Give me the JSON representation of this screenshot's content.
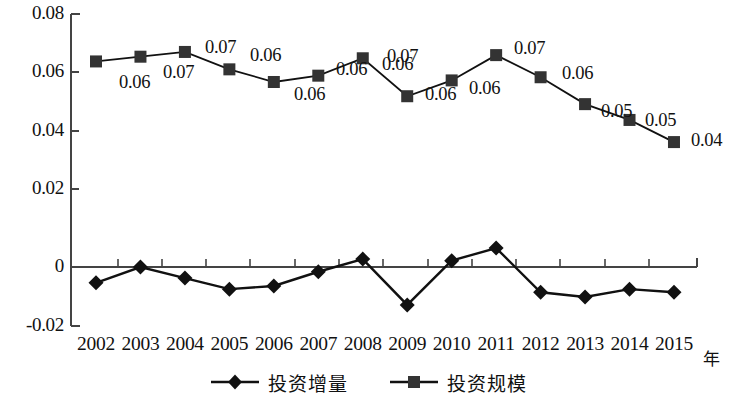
{
  "chart_data": {
    "type": "line",
    "title": "",
    "xlabel": "年",
    "ylabel": "",
    "grid": false,
    "legend_position": "bottom",
    "xlim": [
      2002,
      2015
    ],
    "ylim": [
      -0.02,
      0.08
    ],
    "categories": [
      "2002",
      "2003",
      "2004",
      "2005",
      "2006",
      "2007",
      "2008",
      "2009",
      "2010",
      "2011",
      "2012",
      "2013",
      "2014",
      "2015"
    ],
    "y_ticks": [
      "0.08",
      "0.06",
      "0.04",
      "0.02",
      "0",
      "-0.02"
    ],
    "y_tick_values": [
      0.08,
      0.06,
      0.04,
      0.02,
      0,
      -0.02
    ],
    "series": [
      {
        "name": "投资增量",
        "marker": "diamond",
        "color": "#111111",
        "values": [
          -0.005,
          0.0,
          -0.0035,
          -0.007,
          -0.006,
          -0.0015,
          0.0025,
          -0.012,
          0.002,
          0.006,
          -0.008,
          -0.0095,
          -0.007,
          -0.008
        ],
        "labels": [
          "",
          "",
          "",
          "",
          "",
          "",
          "",
          "",
          "",
          "",
          "",
          "",
          "",
          ""
        ]
      },
      {
        "name": "投资规模",
        "marker": "square",
        "color": "#333333",
        "values": [
          0.065,
          0.0665,
          0.068,
          0.0625,
          0.0585,
          0.0605,
          0.066,
          0.054,
          0.059,
          0.067,
          0.06,
          0.0515,
          0.0465,
          0.0395
        ],
        "labels": [
          "",
          "0.06",
          "0.07",
          "0.07",
          "0.06",
          "0.06",
          "0.06",
          "0.07",
          "0.06",
          "0.06",
          "0.07",
          "0.06",
          "0.05",
          "0.05"
        ],
        "extra_label": "0.04"
      }
    ]
  },
  "axis": {
    "y_labels": [
      {
        "text": "0.08",
        "y": 14
      },
      {
        "text": "0.06",
        "y": 72
      },
      {
        "text": "0.04",
        "y": 131
      },
      {
        "text": "0.02",
        "y": 189
      },
      {
        "text": "0",
        "y": 267
      },
      {
        "text": "-0.02",
        "y": 326
      }
    ],
    "x_unit_label": "年"
  },
  "labels": {
    "upper_series": [
      {
        "text": "0.06",
        "x": 119,
        "y": 72
      },
      {
        "text": "0.07",
        "x": 163,
        "y": 62
      },
      {
        "text": "0.07",
        "x": 205,
        "y": 37
      },
      {
        "text": "0.06",
        "x": 250,
        "y": 45
      },
      {
        "text": "0.06",
        "x": 294,
        "y": 84
      },
      {
        "text": "0.06",
        "x": 336,
        "y": 59
      },
      {
        "text": "0.06",
        "x": 382,
        "y": 54
      },
      {
        "text": "0.07",
        "x": 387,
        "y": 46
      },
      {
        "text": "0.06",
        "x": 425,
        "y": 84
      },
      {
        "text": "0.06",
        "x": 469,
        "y": 78
      },
      {
        "text": "0.07",
        "x": 514,
        "y": 38
      },
      {
        "text": "0.06",
        "x": 562,
        "y": 63
      },
      {
        "text": "0.05",
        "x": 601,
        "y": 101
      },
      {
        "text": "0.05",
        "x": 645,
        "y": 110
      },
      {
        "text": "0.04",
        "x": 691,
        "y": 130
      }
    ]
  },
  "legend": {
    "entries": [
      {
        "label": "投资增量",
        "marker": "diamond"
      },
      {
        "label": "投资规模",
        "marker": "square"
      }
    ]
  }
}
